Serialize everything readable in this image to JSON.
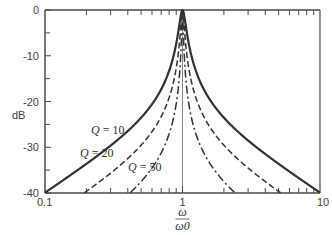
{
  "chart_data": {
    "type": "line",
    "title": "",
    "xlabel": "ω/ω0",
    "xlabel_num": "ω",
    "xlabel_den": "ω0",
    "ylabel": "dB",
    "xscale": "log",
    "xlim": [
      0.1,
      10
    ],
    "ylim": [
      -40,
      0
    ],
    "x_ticks": [
      "0.1",
      "1",
      "10"
    ],
    "y_ticks": [
      "0",
      "-10",
      "-20",
      "-30",
      "-40"
    ],
    "grid": false,
    "formula": "dB = -10*log10(1 + Q^2 (u - 1/u)^2), u = ω/ω0",
    "series": [
      {
        "name": "Q = 10",
        "style": "solid",
        "x": [
          0.1,
          0.2,
          0.5,
          0.8,
          0.9,
          0.95,
          1.0,
          1.05,
          1.1,
          1.25,
          2,
          5,
          10
        ],
        "y": [
          -39.9,
          -33.6,
          -23.5,
          -13.2,
          -6.9,
          -2.6,
          0,
          -2.4,
          -6.3,
          -11.0,
          -23.5,
          -33.6,
          -39.9
        ]
      },
      {
        "name": "Q = 20",
        "style": "dashed",
        "x": [
          0.2,
          0.5,
          0.8,
          0.9,
          0.95,
          1.0,
          1.05,
          1.1,
          1.25,
          2,
          5
        ],
        "y": [
          -39.6,
          -29.5,
          -19.1,
          -12.6,
          -7.1,
          0,
          -6.9,
          -12.1,
          -17.0,
          -29.5,
          -39.6
        ]
      },
      {
        "name": "Q = 50",
        "style": "dash-dot",
        "x": [
          0.4,
          0.5,
          0.8,
          0.9,
          0.95,
          1.0,
          1.05,
          1.1,
          1.25,
          2,
          2.5
        ],
        "y": [
          -39.8,
          -37.5,
          -27.0,
          -20.5,
          -14.6,
          0,
          -14.4,
          -19.6,
          -24.9,
          -37.5,
          -39.8
        ]
      }
    ],
    "annotations": [
      {
        "text": "Q = 10",
        "x": 0.38,
        "y": -27
      },
      {
        "text": "Q = 20",
        "x": 0.42,
        "y": -32
      },
      {
        "text": "Q = 50",
        "x": 0.55,
        "y": -37
      }
    ],
    "reference_line": {
      "x": 1,
      "style": "thin vertical"
    }
  }
}
